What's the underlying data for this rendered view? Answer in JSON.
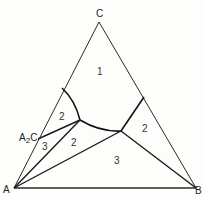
{
  "diagram": {
    "type": "ternary-phase-diagram",
    "vertices": {
      "top": "C",
      "bottom_left": "A",
      "bottom_right": "B"
    },
    "compound_label": {
      "main": "A",
      "sub": "2",
      "tail": "C"
    },
    "regions": {
      "top": "1",
      "upper_left": "2",
      "left_small": "3",
      "middle": "2",
      "right": "2",
      "bottom": "3"
    },
    "colors": {
      "line": "#1a1a1a",
      "background": "#fdfdfb",
      "text": "#333333"
    }
  }
}
